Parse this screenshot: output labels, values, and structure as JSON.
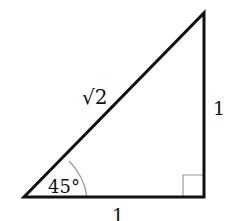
{
  "diagram": {
    "type": "right-triangle",
    "labels": {
      "hypotenuse": "√2",
      "vertical_leg": "1",
      "horizontal_leg": "1",
      "angle": "45°"
    },
    "marks": {
      "right_angle": "square marker at bottom-right vertex",
      "angle_arc": "arc at bottom-left vertex"
    },
    "colors": {
      "stroke": "#111111",
      "arc": "#999999",
      "background": "#ffffff"
    }
  }
}
